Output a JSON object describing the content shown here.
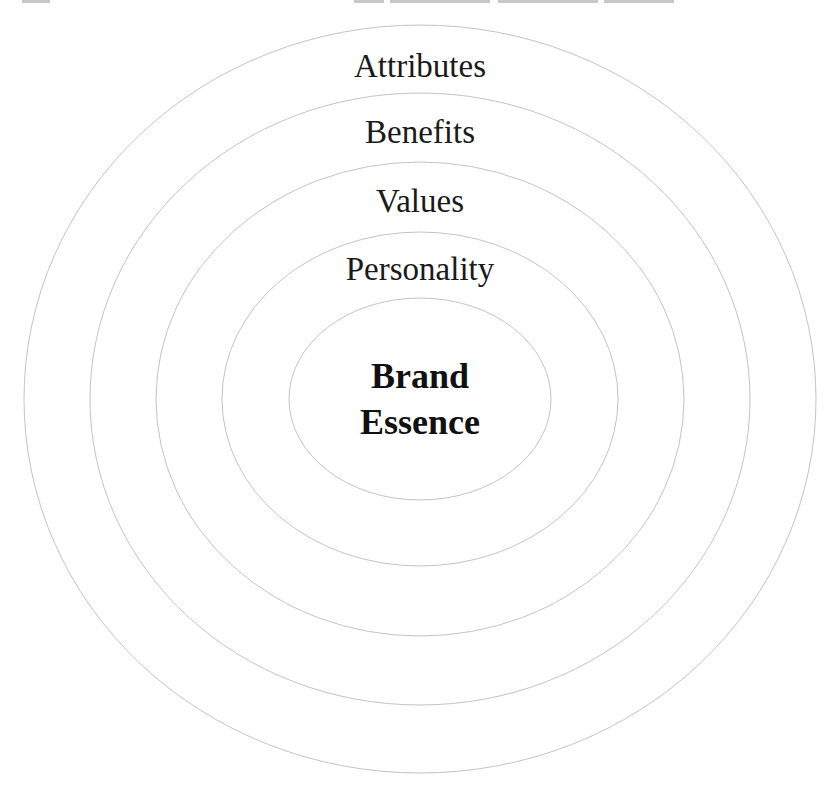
{
  "title": {
    "visible": false,
    "note": "clipped"
  },
  "diagram": {
    "type": "concentric-ellipses",
    "center": {
      "cx": 420,
      "cy": 399
    },
    "stroke_color": "#c4c4c4",
    "text_color": "#1a1a1a",
    "rings": [
      {
        "label": "Attributes",
        "rx": 396,
        "ry": 374,
        "label_y": 77
      },
      {
        "label": "Benefits",
        "rx": 330,
        "ry": 306,
        "label_y": 143
      },
      {
        "label": "Values",
        "rx": 264,
        "ry": 237,
        "label_y": 212
      },
      {
        "label": "Personality",
        "rx": 198,
        "ry": 167,
        "label_y": 280
      }
    ],
    "core": {
      "rx": 131,
      "ry": 101,
      "line1": "Brand",
      "line2": "Essence",
      "line1_y": 388,
      "line2_y": 434
    }
  }
}
